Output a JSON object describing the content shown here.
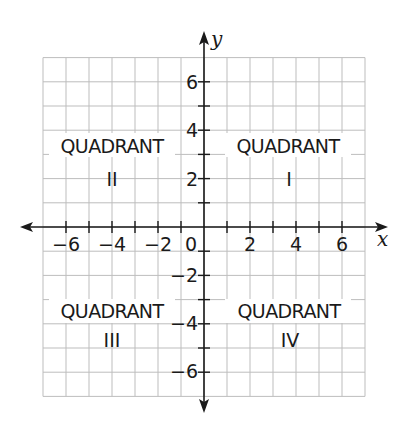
{
  "diagram": {
    "type": "coordinate-plane",
    "axes": {
      "x": {
        "label": "x",
        "min": -7,
        "max": 7,
        "tick_step": 1,
        "labeled_ticks": [
          -6,
          -4,
          -2,
          2,
          4,
          6
        ]
      },
      "y": {
        "label": "y",
        "min": -7,
        "max": 7,
        "tick_step": 1,
        "labeled_ticks": [
          6,
          4,
          2,
          -2,
          -4,
          -6
        ]
      },
      "origin_label": "0"
    },
    "tick_labels": {
      "x": [
        "−6",
        "−4",
        "−2",
        "2",
        "4",
        "6"
      ],
      "y": [
        "6",
        "4",
        "2",
        "−2",
        "−4",
        "−6"
      ]
    },
    "quadrants": [
      {
        "title": "QUADRANT",
        "numeral": "I"
      },
      {
        "title": "QUADRANT",
        "numeral": "II"
      },
      {
        "title": "QUADRANT",
        "numeral": "III"
      },
      {
        "title": "QUADRANT",
        "numeral": "IV"
      }
    ],
    "colors": {
      "grid": "#bdbdbd",
      "axis": "#1a1a1a",
      "background": "#ffffff"
    }
  }
}
